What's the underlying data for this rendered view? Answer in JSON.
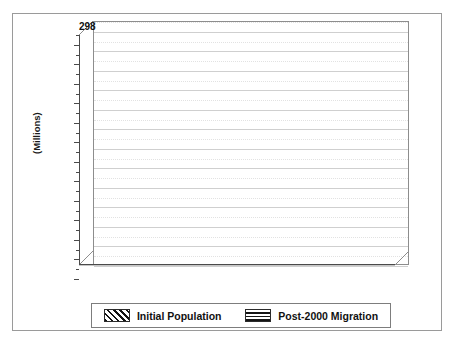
{
  "figure": {
    "background_color": "#ffffff",
    "border_color": "#9a9a9a",
    "caption_top_clipped": "",
    "caption_bottom_clipped": ""
  },
  "axis": {
    "y_label": "(Millions)",
    "y_ticks": [
      "0",
      "40",
      "80",
      "120",
      "160",
      "200",
      "240",
      "280",
      "320",
      "360",
      "400",
      "440",
      "480"
    ],
    "x_ticks_visible": [
      "2000",
      "2020",
      "2040",
      "2060",
      "2080",
      "2100"
    ]
  },
  "annotation": {
    "initial_population_plateau": "298"
  },
  "legend": {
    "items": [
      {
        "label": "Initial Population",
        "pattern": "diagonal-hatch-icon",
        "color": "#141414"
      },
      {
        "label": "Post-2000 Migration",
        "pattern": "horizontal-stripe-icon",
        "color": "#141414"
      }
    ]
  },
  "chart_data": {
    "type": "bar",
    "title": "",
    "subtitle": "",
    "xlabel": "",
    "ylabel": "(Millions)",
    "ylim": [
      0,
      500
    ],
    "y_major_step": 40,
    "y_minor_step": 20,
    "grid": true,
    "stacked": true,
    "three_d": true,
    "legend_position": "bottom",
    "categories": [
      "2000",
      "2010",
      "2020",
      "2030",
      "2040",
      "2050",
      "2060",
      "2070",
      "2080",
      "2090",
      "2100"
    ],
    "x_tick_labels_shown": [
      "2000",
      "",
      "2020",
      "",
      "2040",
      "",
      "2060",
      "",
      "2080",
      "",
      "2100"
    ],
    "totals": [
      279,
      311,
      335,
      355,
      376,
      397,
      418,
      437,
      456,
      475,
      492
    ],
    "data_labels": [
      "279",
      "311",
      "335",
      "355",
      "376",
      "397",
      "418",
      "437",
      "456",
      "475",
      "492"
    ],
    "series": [
      {
        "name": "Initial Population",
        "pattern": "diagonal-hatch",
        "values": [
          279,
          289,
          294,
          297,
          298,
          298,
          298,
          297,
          296,
          294,
          291
        ]
      },
      {
        "name": "Post-2000 Migration",
        "pattern": "horizontal-stripe",
        "values": [
          0,
          22,
          41,
          58,
          78,
          99,
          120,
          140,
          160,
          181,
          201
        ]
      }
    ],
    "annotations": [
      {
        "text": "298",
        "value": 298,
        "note": "Initial Population plateau level marked at right of plot"
      }
    ]
  }
}
